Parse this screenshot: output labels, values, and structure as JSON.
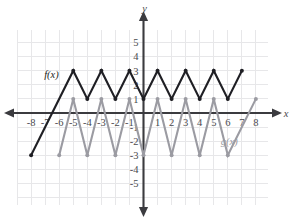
{
  "chart_data": {
    "type": "line",
    "title": "",
    "xlabel": "x",
    "ylabel": "y",
    "xlim": [
      -9,
      9
    ],
    "ylim": [
      -6,
      6
    ],
    "grid": true,
    "grid_step": 1,
    "legend_position": "inline-annotation",
    "x_tick_labels": [
      "-8",
      "-7",
      "-6",
      "-5",
      "-4",
      "-3",
      "-2",
      "-1",
      "1",
      "2",
      "3",
      "4",
      "5",
      "6",
      "7",
      "8"
    ],
    "x_tick_values": [
      -8,
      -7,
      -6,
      -5,
      -4,
      -3,
      -2,
      -1,
      1,
      2,
      3,
      4,
      5,
      6,
      7,
      8
    ],
    "y_tick_labels": [
      "5",
      "4",
      "3",
      "2",
      "1",
      "-1",
      "-2",
      "-3",
      "-4",
      "-5"
    ],
    "y_tick_values": [
      5,
      4,
      3,
      2,
      1,
      -1,
      -2,
      -3,
      -4,
      -5
    ],
    "series": [
      {
        "name": "f(x)",
        "color": "#1f1f24",
        "label": "f(x)",
        "label_point": [
          -6.55,
          2.45
        ],
        "points": [
          [
            -8,
            -3
          ],
          [
            -5,
            3
          ],
          [
            -4,
            1
          ],
          [
            -3,
            3
          ],
          [
            -2,
            1
          ],
          [
            -1,
            3
          ],
          [
            0,
            1
          ],
          [
            1,
            3
          ],
          [
            2,
            1
          ],
          [
            3,
            3
          ],
          [
            4,
            1
          ],
          [
            5,
            3
          ],
          [
            6,
            1
          ],
          [
            7,
            3
          ]
        ],
        "vertices": [
          [
            -8,
            -3
          ],
          [
            -5,
            3
          ],
          [
            -4,
            1
          ],
          [
            -3,
            3
          ],
          [
            -2,
            1
          ],
          [
            -1,
            3
          ],
          [
            0,
            1
          ],
          [
            1,
            3
          ],
          [
            2,
            1
          ],
          [
            3,
            3
          ],
          [
            4,
            1
          ],
          [
            5,
            3
          ],
          [
            6,
            1
          ],
          [
            7,
            3
          ]
        ]
      },
      {
        "name": "g(x)",
        "color": "#9b9ba2",
        "label": "g(x)",
        "label_point": [
          6.1,
          -2.3
        ],
        "points": [
          [
            -6,
            -3
          ],
          [
            -5,
            1
          ],
          [
            -4,
            -3
          ],
          [
            -3,
            1
          ],
          [
            -2,
            -3
          ],
          [
            -1,
            1
          ],
          [
            0,
            -3
          ],
          [
            1,
            1
          ],
          [
            2,
            -3
          ],
          [
            3,
            1
          ],
          [
            4,
            -3
          ],
          [
            5,
            1
          ],
          [
            6,
            -3
          ],
          [
            8,
            1
          ]
        ],
        "vertices": [
          [
            -6,
            -3
          ],
          [
            -5,
            1
          ],
          [
            -4,
            -3
          ],
          [
            -3,
            1
          ],
          [
            -2,
            -3
          ],
          [
            -1,
            1
          ],
          [
            0,
            -3
          ],
          [
            1,
            1
          ],
          [
            2,
            -3
          ],
          [
            3,
            1
          ],
          [
            4,
            -3
          ],
          [
            5,
            1
          ],
          [
            6,
            -3
          ],
          [
            8,
            1
          ]
        ]
      }
    ]
  },
  "axes": {
    "x_axis_name": "x",
    "y_axis_name": "y"
  },
  "colors": {
    "f_series": "#1f1f24",
    "g_series": "#9b9ba2",
    "axis": "#3b3b3f",
    "grid": "#e7e7e9",
    "background": "#ffffff"
  }
}
